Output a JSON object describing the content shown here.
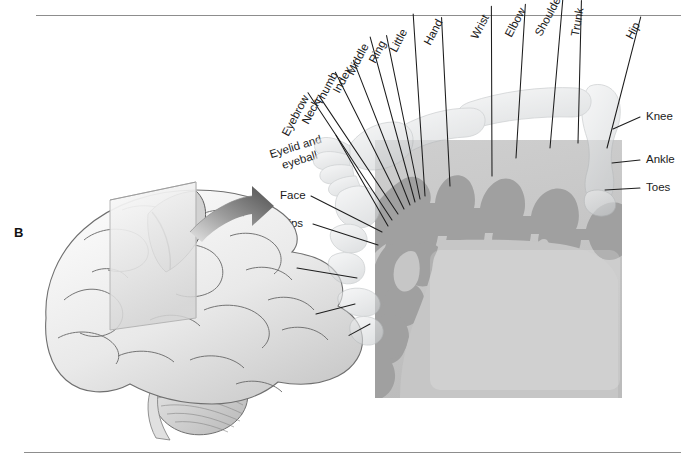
{
  "figure": {
    "panel_letter": "B"
  },
  "colors": {
    "rule": "#8d8d8d",
    "cortex_band": "#a0a0a0",
    "cortex_fill": "#c6c6c6",
    "homunculus": "#d8dadb",
    "brain_outline": "#6f6f6f",
    "brain_fill": "#efefef",
    "arrow_dark": "#5a5a5a",
    "arrow_light": "#d9d9d9",
    "label_text": "#1b1b1b",
    "leader_line": "#1d1d1d"
  },
  "labels_left": [
    {
      "text": "Little",
      "x": 393,
      "y": 45,
      "rotate": -62,
      "anchor_x": 425,
      "anchor_y": 196
    },
    {
      "text": "Ring",
      "x": 372,
      "y": 56,
      "rotate": -62,
      "anchor_x": 420,
      "anchor_y": 199
    },
    {
      "text": "Middle",
      "x": 350,
      "y": 68,
      "rotate": -62,
      "anchor_x": 415,
      "anchor_y": 202
    },
    {
      "text": "Index",
      "x": 336,
      "y": 86,
      "rotate": -62,
      "anchor_x": 410,
      "anchor_y": 205
    },
    {
      "text": "Thumb",
      "x": 318,
      "y": 98,
      "rotate": -62,
      "anchor_x": 404,
      "anchor_y": 209
    },
    {
      "text": "Neck",
      "x": 305,
      "y": 117,
      "rotate": -62,
      "anchor_x": 398,
      "anchor_y": 214
    },
    {
      "text": "Eyebrow",
      "x": 285,
      "y": 129,
      "rotate": -62,
      "anchor_x": 392,
      "anchor_y": 220
    },
    {
      "text": "Eyelid and",
      "x": 272,
      "y": 148,
      "rotate": -17,
      "anchor_x": 388,
      "anchor_y": 226,
      "second_line": "eyeball"
    },
    {
      "text": "Face",
      "x": 280,
      "y": 189,
      "rotate": 0,
      "anchor_x": 382,
      "anchor_y": 232
    },
    {
      "text": "Lips",
      "x": 282,
      "y": 217,
      "rotate": 0,
      "anchor_x": 378,
      "anchor_y": 245
    },
    {
      "text": "Jaw",
      "x": 272,
      "y": 261,
      "rotate": 0,
      "anchor_x": 357,
      "anchor_y": 278
    },
    {
      "text": "Tongue",
      "x": 273,
      "y": 307,
      "rotate": 0,
      "anchor_x": 355,
      "anchor_y": 304
    },
    {
      "text": "Swallowing",
      "x": 285,
      "y": 348,
      "rotate": -17,
      "anchor_x": 370,
      "anchor_y": 324
    }
  ],
  "labels_top": [
    {
      "text": "Hand",
      "x": 427,
      "y": 38,
      "rotate": -62,
      "anchor_x": 450,
      "anchor_y": 186
    },
    {
      "text": "Wrist",
      "x": 474,
      "y": 32,
      "rotate": -62,
      "anchor_x": 492,
      "anchor_y": 176
    },
    {
      "text": "Elbow",
      "x": 508,
      "y": 30,
      "rotate": -62,
      "anchor_x": 516,
      "anchor_y": 158
    },
    {
      "text": "Shoulder",
      "x": 538,
      "y": 29,
      "rotate": -62,
      "anchor_x": 550,
      "anchor_y": 148
    },
    {
      "text": "Trunk",
      "x": 575,
      "y": 30,
      "rotate": -80,
      "anchor_x": 578,
      "anchor_y": 143
    },
    {
      "text": "Hip",
      "x": 629,
      "y": 32,
      "rotate": -62,
      "anchor_x": 607,
      "anchor_y": 148
    }
  ],
  "labels_right": [
    {
      "text": "Knee",
      "x": 646,
      "y": 110,
      "rotate": 0,
      "anchor_x": 613,
      "anchor_y": 129
    },
    {
      "text": "Ankle",
      "x": 646,
      "y": 153,
      "rotate": 0,
      "anchor_x": 612,
      "anchor_y": 163
    },
    {
      "text": "Toes",
      "x": 646,
      "y": 181,
      "rotate": 0,
      "anchor_x": 605,
      "anchor_y": 190
    }
  ]
}
